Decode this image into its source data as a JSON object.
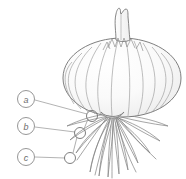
{
  "figure": {
    "background_color": "#ffffff",
    "line_color": "#6e6e6e",
    "fill_color": "#fbfbfb",
    "shading_color": "#e9e9e9"
  },
  "callouts": [
    {
      "id": "a",
      "label": "a",
      "label_x": 26,
      "label_y": 99,
      "target_x": 92,
      "target_y": 116,
      "radius": 8.5,
      "target_radius": 5.5
    },
    {
      "id": "b",
      "label": "b",
      "label_x": 26,
      "label_y": 126,
      "target_x": 80,
      "target_y": 133,
      "radius": 8.5,
      "target_radius": 5.5
    },
    {
      "id": "c",
      "label": "c",
      "label_x": 26,
      "label_y": 157,
      "target_x": 70,
      "target_y": 158,
      "radius": 8.5,
      "target_radius": 5.5
    }
  ],
  "connectors": [
    {
      "from": "a-target",
      "to": "b-target"
    },
    {
      "from": "b-target",
      "to": "c-target"
    }
  ],
  "bulb": {
    "center_x": 122,
    "center_y": 78,
    "width": 118,
    "height": 76,
    "neck_tip_y": 8,
    "basal_plate_x": 112,
    "basal_plate_y": 117,
    "scale_line_count": 11,
    "root_count": 17
  }
}
